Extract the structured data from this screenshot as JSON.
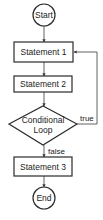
{
  "diagram": {
    "type": "flowchart",
    "nodes": [
      {
        "id": "start",
        "shape": "circle",
        "label": "Start"
      },
      {
        "id": "s1",
        "shape": "rect",
        "label": "Statement 1"
      },
      {
        "id": "s2",
        "shape": "rect",
        "label": "Statement 2"
      },
      {
        "id": "cond",
        "shape": "diamond",
        "label_line1": "Conditional",
        "label_line2": "Loop"
      },
      {
        "id": "s3",
        "shape": "rect",
        "label": "Statement 3"
      },
      {
        "id": "end",
        "shape": "circle",
        "label": "End"
      }
    ],
    "edges": [
      {
        "from": "start",
        "to": "s1",
        "label": ""
      },
      {
        "from": "s1",
        "to": "s2",
        "label": ""
      },
      {
        "from": "s2",
        "to": "cond",
        "label": ""
      },
      {
        "from": "cond",
        "to": "s1",
        "label": "true"
      },
      {
        "from": "cond",
        "to": "s3",
        "label": "false"
      },
      {
        "from": "s3",
        "to": "end",
        "label": ""
      }
    ]
  }
}
